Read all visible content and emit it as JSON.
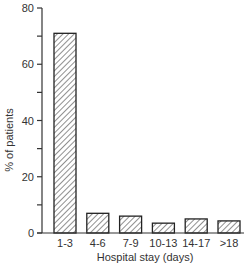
{
  "chart_data": {
    "type": "bar",
    "title": "",
    "xlabel": "Hospital stay (days)",
    "ylabel": "% of patients",
    "categories": [
      "1-3",
      "4-6",
      "7-9",
      "10-13",
      "14-17",
      ">18"
    ],
    "values": [
      71,
      7,
      6,
      3.5,
      5,
      4.3
    ],
    "ylim": [
      0,
      80
    ],
    "yticks": [
      0,
      20,
      40,
      60,
      80
    ],
    "yminor_ticks": [
      10,
      30,
      50,
      70
    ],
    "grid": false,
    "legend": null,
    "bar_fill": "diagonal-hatch",
    "bar_stroke": "#222222"
  }
}
